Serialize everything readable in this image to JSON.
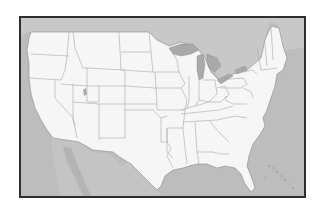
{
  "map": {
    "title": "Outline map of the contiguous United States",
    "region": "Contiguous United States",
    "style": "blank outline",
    "colors": {
      "frame": "#2e2e2e",
      "water_and_foreign_land": "#bdbdbd",
      "canada": "#c8c8c8",
      "mexico": "#c4c4c4",
      "great_lakes": "#a9a9a9",
      "states_fill": "#f6f6f6",
      "state_borders": "#a0a0a0"
    },
    "labels": [],
    "visible_features": [
      "Canada",
      "Mexico",
      "Great Lakes",
      "Gulf of Mexico",
      "Atlantic Ocean",
      "Pacific Ocean",
      "Bahamas",
      "Baja California"
    ]
  }
}
